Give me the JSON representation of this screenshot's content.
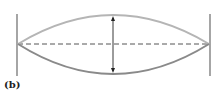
{
  "figure": {
    "label": "(b)",
    "colors": {
      "upper_curve": "#b8b8b8",
      "lower_curve": "#8c8c8c",
      "walls": "#666666",
      "axis": "#555555",
      "arrow": "#222222"
    }
  }
}
